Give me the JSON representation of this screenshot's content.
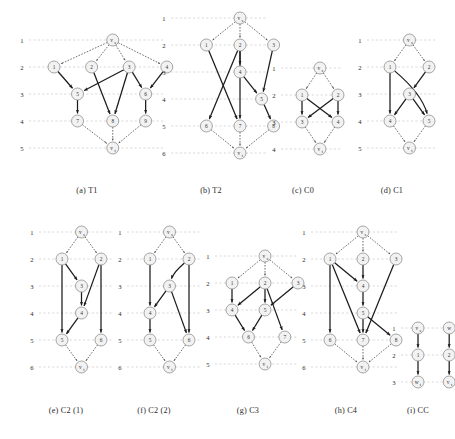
{
  "figure": {
    "background_color": "#ffffff",
    "node_fill": "#f2f2f2",
    "node_stroke": "#8a8a8a",
    "solid_edge_color": "#1c1c1c",
    "dotted_edge_color": "#4a4a4a",
    "layer_line_color": "#c9c9c9"
  },
  "panels": [
    {
      "id": "t1",
      "caption": "(a) T1",
      "layer_labels": [
        "1",
        "2",
        "3",
        "4",
        "5"
      ],
      "nodes": [
        {
          "id": "vs",
          "label": "v",
          "sub": "s",
          "layer": 1,
          "col": 2.5
        },
        {
          "id": "1",
          "label": "1",
          "layer": 2,
          "col": 0
        },
        {
          "id": "2",
          "label": "2",
          "layer": 2,
          "col": 1.6
        },
        {
          "id": "3",
          "label": "3",
          "layer": 2,
          "col": 3.2
        },
        {
          "id": "4",
          "label": "4",
          "layer": 2,
          "col": 4.8
        },
        {
          "id": "5",
          "label": "5",
          "layer": 3,
          "col": 1.0
        },
        {
          "id": "6",
          "label": "6",
          "layer": 3,
          "col": 3.9
        },
        {
          "id": "7",
          "label": "7",
          "layer": 4,
          "col": 1.0
        },
        {
          "id": "8",
          "label": "8",
          "layer": 4,
          "col": 2.5
        },
        {
          "id": "9",
          "label": "9",
          "layer": 4,
          "col": 3.9
        },
        {
          "id": "vt",
          "label": "v",
          "sub": "t",
          "layer": 5,
          "col": 2.5
        }
      ],
      "edges": [
        {
          "from": "vs",
          "to": "1",
          "style": "dotted"
        },
        {
          "from": "vs",
          "to": "2",
          "style": "dotted"
        },
        {
          "from": "vs",
          "to": "3",
          "style": "dotted"
        },
        {
          "from": "vs",
          "to": "4",
          "style": "dotted"
        },
        {
          "from": "1",
          "to": "5",
          "style": "solid"
        },
        {
          "from": "2",
          "to": "8",
          "style": "solid"
        },
        {
          "from": "3",
          "to": "5",
          "style": "solid"
        },
        {
          "from": "3",
          "to": "6",
          "style": "solid"
        },
        {
          "from": "3",
          "to": "8",
          "style": "solid"
        },
        {
          "from": "4",
          "to": "6",
          "style": "solid"
        },
        {
          "from": "5",
          "to": "7",
          "style": "solid"
        },
        {
          "from": "6",
          "to": "9",
          "style": "solid"
        },
        {
          "from": "7",
          "to": "vt",
          "style": "dotted"
        },
        {
          "from": "8",
          "to": "vt",
          "style": "dotted"
        },
        {
          "from": "9",
          "to": "vt",
          "style": "dotted"
        }
      ]
    },
    {
      "id": "t2",
      "caption": "(b) T2",
      "layer_labels": [
        "1",
        "2",
        "3",
        "4",
        "5",
        "6"
      ],
      "nodes": [
        {
          "id": "vs",
          "label": "v",
          "sub": "s",
          "layer": 1,
          "col": 2.0
        },
        {
          "id": "1",
          "label": "1",
          "layer": 2,
          "col": 0.6
        },
        {
          "id": "2",
          "label": "2",
          "layer": 2,
          "col": 2.0
        },
        {
          "id": "3",
          "label": "3",
          "layer": 2,
          "col": 3.4
        },
        {
          "id": "4",
          "label": "4",
          "layer": 3,
          "col": 2.0
        },
        {
          "id": "5",
          "label": "5",
          "layer": 4,
          "col": 2.9
        },
        {
          "id": "6",
          "label": "6",
          "layer": 5,
          "col": 0.6
        },
        {
          "id": "7",
          "label": "7",
          "layer": 5,
          "col": 2.0
        },
        {
          "id": "8",
          "label": "8",
          "layer": 5,
          "col": 3.4
        },
        {
          "id": "vt",
          "label": "v",
          "sub": "t",
          "layer": 6,
          "col": 2.0
        }
      ],
      "edges": [
        {
          "from": "vs",
          "to": "1",
          "style": "dotted"
        },
        {
          "from": "vs",
          "to": "2",
          "style": "dotted"
        },
        {
          "from": "vs",
          "to": "3",
          "style": "dotted"
        },
        {
          "from": "1",
          "to": "7",
          "style": "solid"
        },
        {
          "from": "2",
          "to": "4",
          "style": "solid"
        },
        {
          "from": "2",
          "to": "6",
          "style": "solid"
        },
        {
          "from": "2",
          "to": "7",
          "style": "solid"
        },
        {
          "from": "3",
          "to": "5",
          "style": "solid"
        },
        {
          "from": "4",
          "to": "5",
          "style": "solid"
        },
        {
          "from": "5",
          "to": "8",
          "style": "solid"
        },
        {
          "from": "6",
          "to": "vt",
          "style": "dotted"
        },
        {
          "from": "7",
          "to": "vt",
          "style": "dotted"
        },
        {
          "from": "8",
          "to": "vt",
          "style": "dotted"
        }
      ]
    },
    {
      "id": "c0",
      "caption": "(c) C0",
      "layer_labels": [
        "1",
        "2",
        "3",
        "4"
      ],
      "nodes": [
        {
          "id": "vs",
          "label": "v",
          "sub": "s",
          "layer": 1,
          "col": 0.75
        },
        {
          "id": "1",
          "label": "1",
          "layer": 2,
          "col": 0
        },
        {
          "id": "2",
          "label": "2",
          "layer": 2,
          "col": 1.5
        },
        {
          "id": "3",
          "label": "3",
          "layer": 3,
          "col": 0
        },
        {
          "id": "4",
          "label": "4",
          "layer": 3,
          "col": 1.5
        },
        {
          "id": "vt",
          "label": "v",
          "sub": "t",
          "layer": 4,
          "col": 0.75
        }
      ],
      "edges": [
        {
          "from": "vs",
          "to": "1",
          "style": "dotted"
        },
        {
          "from": "vs",
          "to": "2",
          "style": "dotted"
        },
        {
          "from": "1",
          "to": "3",
          "style": "solid"
        },
        {
          "from": "1",
          "to": "4",
          "style": "solid"
        },
        {
          "from": "2",
          "to": "3",
          "style": "solid"
        },
        {
          "from": "2",
          "to": "4",
          "style": "solid"
        },
        {
          "from": "3",
          "to": "vt",
          "style": "dotted"
        },
        {
          "from": "4",
          "to": "vt",
          "style": "dotted"
        }
      ]
    },
    {
      "id": "c1",
      "caption": "(d) C1",
      "layer_labels": [
        "1",
        "2",
        "3",
        "4",
        "5"
      ],
      "nodes": [
        {
          "id": "vs",
          "label": "v",
          "sub": "s",
          "layer": 1,
          "col": 0.75
        },
        {
          "id": "1",
          "label": "1",
          "layer": 2,
          "col": 0
        },
        {
          "id": "2",
          "label": "2",
          "layer": 2,
          "col": 1.5
        },
        {
          "id": "3",
          "label": "3",
          "layer": 3,
          "col": 0.75
        },
        {
          "id": "4",
          "label": "4",
          "layer": 4,
          "col": 0
        },
        {
          "id": "5",
          "label": "5",
          "layer": 4,
          "col": 1.5
        },
        {
          "id": "vt",
          "label": "v",
          "sub": "t",
          "layer": 5,
          "col": 0.75
        }
      ],
      "edges": [
        {
          "from": "vs",
          "to": "1",
          "style": "dotted"
        },
        {
          "from": "vs",
          "to": "2",
          "style": "dotted"
        },
        {
          "from": "1",
          "to": "4",
          "style": "solid"
        },
        {
          "from": "1",
          "to": "5",
          "style": "solid",
          "curve": 0.55
        },
        {
          "from": "2",
          "to": "3",
          "style": "solid"
        },
        {
          "from": "3",
          "to": "4",
          "style": "solid"
        },
        {
          "from": "3",
          "to": "5",
          "style": "solid"
        },
        {
          "from": "4",
          "to": "vt",
          "style": "dotted"
        },
        {
          "from": "5",
          "to": "vt",
          "style": "dotted"
        }
      ]
    },
    {
      "id": "c2a",
      "caption": "(e) C2 (1)",
      "layer_labels": [
        "1",
        "2",
        "3",
        "4",
        "5",
        "6"
      ],
      "nodes": [
        {
          "id": "vs",
          "label": "v",
          "sub": "s",
          "layer": 1,
          "col": 0.75
        },
        {
          "id": "1",
          "label": "1",
          "layer": 2,
          "col": 0
        },
        {
          "id": "2",
          "label": "2",
          "layer": 2,
          "col": 1.5
        },
        {
          "id": "3",
          "label": "3",
          "layer": 3,
          "col": 0.75
        },
        {
          "id": "4",
          "label": "4",
          "layer": 4,
          "col": 0.75
        },
        {
          "id": "5",
          "label": "5",
          "layer": 5,
          "col": 0
        },
        {
          "id": "6",
          "label": "6",
          "layer": 5,
          "col": 1.5
        },
        {
          "id": "vt",
          "label": "v",
          "sub": "t",
          "layer": 6,
          "col": 0.75
        }
      ],
      "edges": [
        {
          "from": "vs",
          "to": "1",
          "style": "dotted"
        },
        {
          "from": "vs",
          "to": "2",
          "style": "dotted"
        },
        {
          "from": "1",
          "to": "3",
          "style": "solid"
        },
        {
          "from": "1",
          "to": "5",
          "style": "solid"
        },
        {
          "from": "2",
          "to": "4",
          "style": "solid"
        },
        {
          "from": "2",
          "to": "6",
          "style": "solid"
        },
        {
          "from": "3",
          "to": "4",
          "style": "solid"
        },
        {
          "from": "4",
          "to": "5",
          "style": "solid"
        },
        {
          "from": "5",
          "to": "vt",
          "style": "dotted"
        },
        {
          "from": "6",
          "to": "vt",
          "style": "dotted"
        }
      ]
    },
    {
      "id": "c2b",
      "caption": "(f) C2 (2)",
      "layer_labels": [
        "1",
        "2",
        "3",
        "4",
        "5",
        "6"
      ],
      "nodes": [
        {
          "id": "vs",
          "label": "v",
          "sub": "s",
          "layer": 1,
          "col": 0.75
        },
        {
          "id": "1",
          "label": "1",
          "layer": 2,
          "col": 0
        },
        {
          "id": "2",
          "label": "2",
          "layer": 2,
          "col": 1.5
        },
        {
          "id": "3",
          "label": "3",
          "layer": 3,
          "col": 0.75
        },
        {
          "id": "4",
          "label": "4",
          "layer": 4,
          "col": 0
        },
        {
          "id": "5",
          "label": "5",
          "layer": 5,
          "col": 0
        },
        {
          "id": "6",
          "label": "6",
          "layer": 5,
          "col": 1.5
        },
        {
          "id": "vt",
          "label": "v",
          "sub": "t",
          "layer": 6,
          "col": 0.75
        }
      ],
      "edges": [
        {
          "from": "vs",
          "to": "1",
          "style": "dotted"
        },
        {
          "from": "vs",
          "to": "2",
          "style": "dotted"
        },
        {
          "from": "1",
          "to": "4",
          "style": "solid"
        },
        {
          "from": "2",
          "to": "3",
          "style": "solid",
          "curve": -0.5
        },
        {
          "from": "2",
          "to": "6",
          "style": "solid"
        },
        {
          "from": "3",
          "to": "4",
          "style": "solid"
        },
        {
          "from": "3",
          "to": "6",
          "style": "solid"
        },
        {
          "from": "4",
          "to": "5",
          "style": "solid"
        },
        {
          "from": "5",
          "to": "vt",
          "style": "dotted"
        },
        {
          "from": "6",
          "to": "vt",
          "style": "dotted"
        }
      ]
    },
    {
      "id": "c3",
      "caption": "(g) C3",
      "layer_labels": [
        "1",
        "2",
        "3",
        "4",
        "5"
      ],
      "nodes": [
        {
          "id": "vs",
          "label": "v",
          "sub": "s",
          "layer": 1,
          "col": 1.5
        },
        {
          "id": "1",
          "label": "1",
          "layer": 2,
          "col": 0
        },
        {
          "id": "2",
          "label": "2",
          "layer": 2,
          "col": 1.5
        },
        {
          "id": "3",
          "label": "3",
          "layer": 2,
          "col": 3.0
        },
        {
          "id": "4",
          "label": "4",
          "layer": 3,
          "col": 0
        },
        {
          "id": "5",
          "label": "5",
          "layer": 3,
          "col": 1.5
        },
        {
          "id": "6",
          "label": "6",
          "layer": 4,
          "col": 0.75
        },
        {
          "id": "7",
          "label": "7",
          "layer": 4,
          "col": 2.4
        },
        {
          "id": "vt",
          "label": "v",
          "sub": "t",
          "layer": 5,
          "col": 1.5
        }
      ],
      "edges": [
        {
          "from": "vs",
          "to": "1",
          "style": "dotted"
        },
        {
          "from": "vs",
          "to": "2",
          "style": "dotted"
        },
        {
          "from": "vs",
          "to": "3",
          "style": "dotted"
        },
        {
          "from": "1",
          "to": "4",
          "style": "solid"
        },
        {
          "from": "2",
          "to": "4",
          "style": "solid"
        },
        {
          "from": "2",
          "to": "5",
          "style": "solid"
        },
        {
          "from": "2",
          "to": "7",
          "style": "solid"
        },
        {
          "from": "3",
          "to": "5",
          "style": "solid"
        },
        {
          "from": "4",
          "to": "6",
          "style": "solid"
        },
        {
          "from": "5",
          "to": "6",
          "style": "solid"
        },
        {
          "from": "6",
          "to": "vt",
          "style": "dotted"
        },
        {
          "from": "7",
          "to": "vt",
          "style": "dotted"
        }
      ]
    },
    {
      "id": "c4",
      "caption": "(h) C4",
      "layer_labels": [
        "1",
        "2",
        "3",
        "4",
        "5",
        "6"
      ],
      "nodes": [
        {
          "id": "vs",
          "label": "v",
          "sub": "s",
          "layer": 1,
          "col": 1.5
        },
        {
          "id": "1",
          "label": "1",
          "layer": 2,
          "col": 0
        },
        {
          "id": "2",
          "label": "2",
          "layer": 2,
          "col": 1.5
        },
        {
          "id": "3",
          "label": "3",
          "layer": 2,
          "col": 3.0
        },
        {
          "id": "4",
          "label": "4",
          "layer": 3,
          "col": 1.5
        },
        {
          "id": "5",
          "label": "5",
          "layer": 4,
          "col": 1.5
        },
        {
          "id": "6",
          "label": "6",
          "layer": 5,
          "col": 0
        },
        {
          "id": "7",
          "label": "7",
          "layer": 5,
          "col": 1.5
        },
        {
          "id": "8",
          "label": "8",
          "layer": 5,
          "col": 3.0
        },
        {
          "id": "vt",
          "label": "v",
          "sub": "t",
          "layer": 6,
          "col": 1.5
        }
      ],
      "edges": [
        {
          "from": "vs",
          "to": "1",
          "style": "dotted"
        },
        {
          "from": "vs",
          "to": "2",
          "style": "dotted"
        },
        {
          "from": "vs",
          "to": "3",
          "style": "dotted"
        },
        {
          "from": "1",
          "to": "4",
          "style": "solid"
        },
        {
          "from": "1",
          "to": "6",
          "style": "solid"
        },
        {
          "from": "1",
          "to": "7",
          "style": "solid"
        },
        {
          "from": "2",
          "to": "4",
          "style": "solid"
        },
        {
          "from": "3",
          "to": "7",
          "style": "solid"
        },
        {
          "from": "4",
          "to": "5",
          "style": "solid"
        },
        {
          "from": "5",
          "to": "7",
          "style": "solid"
        },
        {
          "from": "5",
          "to": "8",
          "style": "solid"
        },
        {
          "from": "6",
          "to": "vt",
          "style": "dotted"
        },
        {
          "from": "7",
          "to": "vt",
          "style": "dotted"
        },
        {
          "from": "8",
          "to": "vt",
          "style": "dotted"
        }
      ]
    },
    {
      "id": "cc",
      "caption": "(i) CC",
      "layer_labels": [
        "1",
        "2",
        "3"
      ],
      "nodes": [
        {
          "id": "vs",
          "label": "v",
          "sub": "s",
          "layer": 1,
          "col": 0
        },
        {
          "id": "w",
          "label": "w",
          "layer": 1,
          "col": 1.2
        },
        {
          "id": "1",
          "label": "1",
          "layer": 2,
          "col": 0
        },
        {
          "id": "2",
          "label": "2",
          "layer": 2,
          "col": 1.2
        },
        {
          "id": "ws",
          "label": "w",
          "sub": "t",
          "layer": 3,
          "col": 0
        },
        {
          "id": "vt",
          "label": "v",
          "sub": "t",
          "layer": 3,
          "col": 1.2
        }
      ],
      "edges": [
        {
          "from": "vs",
          "to": "1",
          "style": "solid"
        },
        {
          "from": "w",
          "to": "2",
          "style": "solid"
        },
        {
          "from": "1",
          "to": "ws",
          "style": "solid"
        },
        {
          "from": "2",
          "to": "vt",
          "style": "solid"
        }
      ]
    }
  ]
}
